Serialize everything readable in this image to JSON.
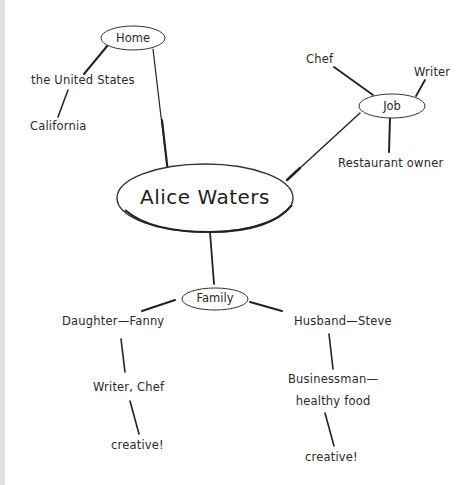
{
  "diagram": {
    "type": "mind-map",
    "center": {
      "label": "Alice Waters"
    },
    "branches": [
      {
        "label": "Home",
        "children": [
          {
            "label": "the United States",
            "children": [
              {
                "label": "California"
              }
            ]
          }
        ]
      },
      {
        "label": "Job",
        "children": [
          {
            "label": "Chef"
          },
          {
            "label": "Writer"
          },
          {
            "label": "Restaurant owner"
          }
        ]
      },
      {
        "label": "Family",
        "children": [
          {
            "label": "Daughter—Fanny",
            "children": [
              {
                "label": "Writer, Chef",
                "children": [
                  {
                    "label": "creative!"
                  }
                ]
              }
            ]
          },
          {
            "label": "Husband—Steve",
            "children": [
              {
                "label_line1": "Businessman—",
                "label_line2": "healthy food",
                "children": [
                  {
                    "label": "creative!"
                  }
                ]
              }
            ]
          }
        ]
      }
    ]
  },
  "colors": {
    "stroke": "#222222",
    "background": "#ffffff",
    "left_strip": "#e2e2e2"
  }
}
